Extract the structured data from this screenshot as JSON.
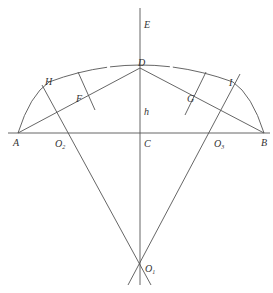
{
  "diagram": {
    "type": "geometric-construction",
    "points": {
      "A": {
        "label": "A",
        "x": 18,
        "y": 133
      },
      "B": {
        "label": "B",
        "x": 264,
        "y": 133
      },
      "C": {
        "label": "C",
        "x": 140,
        "y": 133
      },
      "D": {
        "label": "D",
        "x": 140,
        "y": 68
      },
      "E": {
        "label": "E",
        "x": 140,
        "y": 22
      },
      "F": {
        "label": "F",
        "x": 79,
        "y": 98
      },
      "G": {
        "label": "G",
        "x": 190,
        "y": 98
      },
      "H": {
        "label": "H",
        "x": 49,
        "y": 78
      },
      "I": {
        "label": "I",
        "x": 231,
        "y": 80
      },
      "O1": {
        "label": "O",
        "sub": "1",
        "x": 140,
        "y": 267
      },
      "O2": {
        "label": "O",
        "sub": "2",
        "x": 68,
        "y": 133
      },
      "O3": {
        "label": "O",
        "sub": "3",
        "x": 212,
        "y": 133
      }
    },
    "h_label": "h",
    "colors": {
      "line": "#555555",
      "text": "#333333",
      "background": "#ffffff"
    }
  }
}
